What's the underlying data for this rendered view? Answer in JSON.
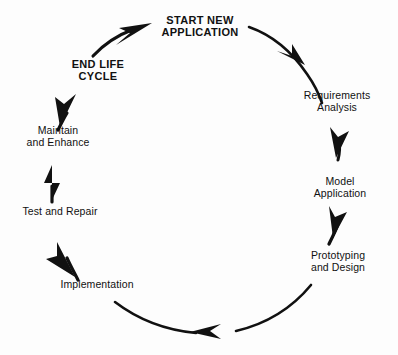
{
  "diagram": {
    "type": "circular-cycle",
    "direction": "clockwise",
    "ink_color": "#111111",
    "background_color": "#fdfdfd",
    "stages": [
      {
        "id": "start-new-application",
        "label": "START NEW\nAPPLICATION",
        "style": "emphasis",
        "position": "top"
      },
      {
        "id": "requirements-analysis",
        "label": "Requirements\nAnalysis",
        "style": "regular",
        "position": "upper-right"
      },
      {
        "id": "model-application",
        "label": "Model\nApplication",
        "style": "regular",
        "position": "right"
      },
      {
        "id": "prototyping-and-design",
        "label": "Prototyping\nand Design",
        "style": "regular",
        "position": "lower-right"
      },
      {
        "id": "implementation",
        "label": "Implementation",
        "style": "regular",
        "position": "lower-left"
      },
      {
        "id": "test-and-repair",
        "label": "Test and Repair",
        "style": "regular",
        "position": "left"
      },
      {
        "id": "maintain-and-enhance",
        "label": "Maintain\nand Enhance",
        "style": "regular",
        "position": "upper-left"
      },
      {
        "id": "end-life-cycle",
        "label": "END LIFE\nCYCLE",
        "style": "emphasis",
        "position": "top-left"
      }
    ],
    "connectors": [
      {
        "id": "arrow-start-to-requirements",
        "from": "start-new-application",
        "to": "requirements-analysis",
        "shape": "long-arc"
      },
      {
        "id": "arrow-requirements-to-model",
        "from": "requirements-analysis",
        "to": "model-application",
        "shape": "short-straight"
      },
      {
        "id": "arrow-model-to-prototyping",
        "from": "model-application",
        "to": "prototyping-and-design",
        "shape": "short-straight"
      },
      {
        "id": "arrow-prototyping-to-implementation",
        "from": "prototyping-and-design",
        "to": "implementation",
        "shape": "long-arc"
      },
      {
        "id": "arrow-implementation-to-test",
        "from": "implementation",
        "to": "test-and-repair",
        "shape": "short-straight"
      },
      {
        "id": "arrow-test-to-maintain",
        "from": "test-and-repair",
        "to": "maintain-and-enhance",
        "shape": "short-straight"
      },
      {
        "id": "arrow-maintain-to-end",
        "from": "maintain-and-enhance",
        "to": "end-life-cycle",
        "shape": "short-straight"
      },
      {
        "id": "arrow-end-to-start",
        "from": "end-life-cycle",
        "to": "start-new-application",
        "shape": "long-arc"
      }
    ]
  }
}
